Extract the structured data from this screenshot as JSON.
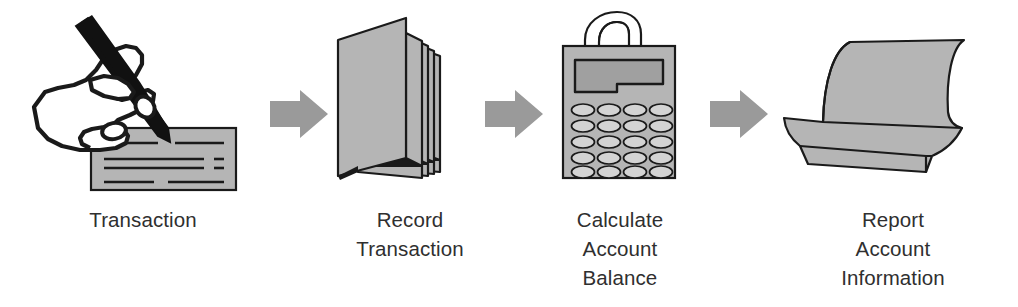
{
  "diagram": {
    "background_color": "#ffffff",
    "text_color": "#2f2f2f",
    "fill_gray": "#b5b5b5",
    "arrow_gray": "#9a9a9a",
    "outline_color": "#1a1a1a",
    "ink_color": "#111111",
    "display_gray": "#a0a0a0"
  },
  "steps": [
    {
      "index": 1,
      "icon": "hand-writing-check-icon",
      "label_line1": "Transaction",
      "label_line2": "",
      "label_line3": ""
    },
    {
      "index": 2,
      "icon": "ledger-pages-stack-icon",
      "label_line1": "Record",
      "label_line2": "Transaction",
      "label_line3": ""
    },
    {
      "index": 3,
      "icon": "calculator-with-tape-icon",
      "label_line1": "Calculate",
      "label_line2": "Account",
      "label_line3": "Balance"
    },
    {
      "index": 4,
      "icon": "folded-report-paper-icon",
      "label_line1": "Report",
      "label_line2": "Account",
      "label_line3": "Information"
    }
  ],
  "arrows": [
    {
      "index": 1,
      "icon": "arrow-right-icon",
      "from": "Transaction",
      "to": "Record Transaction"
    },
    {
      "index": 2,
      "icon": "arrow-right-icon",
      "from": "Record Transaction",
      "to": "Calculate Account Balance"
    },
    {
      "index": 3,
      "icon": "arrow-right-icon",
      "from": "Calculate Account Balance",
      "to": "Report Account Information"
    }
  ]
}
